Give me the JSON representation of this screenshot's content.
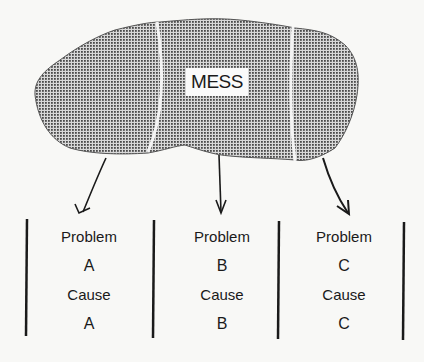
{
  "diagram": {
    "mess": {
      "label": "MESS"
    },
    "columns": [
      {
        "problem_label": "Problem",
        "problem_id": "A",
        "cause_label": "Cause",
        "cause_id": "A"
      },
      {
        "problem_label": "Problem",
        "problem_id": "B",
        "cause_label": "Cause",
        "cause_id": "B"
      },
      {
        "problem_label": "Problem",
        "problem_id": "C",
        "cause_label": "Cause",
        "cause_id": "C"
      }
    ],
    "colors": {
      "ink": "#1a1a1a",
      "blob": "#8a8a8a",
      "background": "#f8f8f6"
    }
  }
}
